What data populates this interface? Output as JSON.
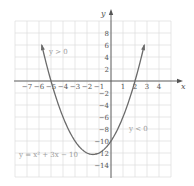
{
  "chart_data": {
    "type": "line",
    "title": "",
    "xlabel": "x",
    "ylabel": "y",
    "xlim": [
      -8,
      5
    ],
    "ylim": [
      -16,
      10
    ],
    "grid": true,
    "x_ticks": [
      -7,
      -6,
      -5,
      -4,
      -3,
      -2,
      -1,
      1,
      2,
      3,
      4
    ],
    "y_ticks": [
      8,
      6,
      4,
      2,
      -2,
      -4,
      -6,
      -8,
      -10,
      -12,
      -14
    ],
    "series": [
      {
        "name": "y = x^2 + 3x - 10",
        "equation": "y = x² + 3x − 10",
        "x_range": [
          -5.77,
          2.77
        ],
        "vertex": [
          -1.5,
          -12.25
        ],
        "x_intercepts": [
          -5,
          2
        ],
        "y_intercept": -10,
        "arrows_at_ends": true,
        "color": "#6b6b6b"
      }
    ],
    "annotations": [
      {
        "text": "y > 0",
        "x": -4.5,
        "y": 6
      },
      {
        "text": "y < 0",
        "x": 4,
        "y": -8
      },
      {
        "text": "y = x² + 3x − 10",
        "x": -6.5,
        "y": -12
      }
    ]
  },
  "labels": {
    "x_axis": "x",
    "y_axis": "y",
    "region_positive": "y > 0",
    "region_negative": "y < 0",
    "equation": "y = x² + 3x − 10"
  },
  "colors": {
    "grid": "#dddddd",
    "axis": "#555555",
    "curve": "#6b6b6b",
    "annotation": "#9a9a9a"
  }
}
